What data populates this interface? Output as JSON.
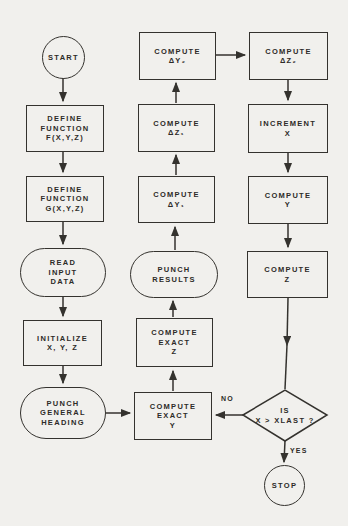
{
  "figure": {
    "type": "flowchart",
    "colors": {
      "paper": "#f1f0ed",
      "ink": "#34322e"
    }
  },
  "nodes": {
    "start": {
      "shape": "terminal-circle",
      "label": [
        "START"
      ]
    },
    "define_f": {
      "shape": "process-rect",
      "label": [
        "DEFINE",
        "FUNCTION",
        "F(X,Y,Z)"
      ]
    },
    "define_g": {
      "shape": "process-rect",
      "label": [
        "DEFINE",
        "FUNCTION",
        "G(X,Y,Z)"
      ]
    },
    "read_input": {
      "shape": "io-stadium",
      "label": [
        "READ",
        "INPUT",
        "DATA"
      ]
    },
    "initialize": {
      "shape": "process-rect",
      "label": [
        "INITIALIZE",
        "X, Y, Z"
      ]
    },
    "punch_heading": {
      "shape": "io-stadium",
      "label": [
        "PUNCH",
        "GENERAL",
        "HEADING"
      ]
    },
    "compute_dy2": {
      "shape": "process-rect",
      "label": [
        "COMPUTE",
        "ΔY₂"
      ]
    },
    "compute_dz1": {
      "shape": "process-rect",
      "label": [
        "COMPUTE",
        "ΔZ₁"
      ]
    },
    "compute_dy1": {
      "shape": "process-rect",
      "label": [
        "COMPUTE",
        "ΔY₁"
      ]
    },
    "punch_results": {
      "shape": "io-stadium",
      "label": [
        "PUNCH",
        "RESULTS"
      ]
    },
    "compute_exact_z": {
      "shape": "process-rect",
      "label": [
        "COMPUTE",
        "EXACT",
        "Z"
      ]
    },
    "compute_exact_y": {
      "shape": "process-rect",
      "label": [
        "COMPUTE",
        "EXACT",
        "Y"
      ]
    },
    "compute_dz2": {
      "shape": "process-rect",
      "label": [
        "COMPUTE",
        "ΔZ₂"
      ]
    },
    "increment_x": {
      "shape": "process-rect",
      "label": [
        "INCREMENT",
        "X"
      ]
    },
    "compute_y": {
      "shape": "process-rect",
      "label": [
        "COMPUTE",
        "Y"
      ]
    },
    "compute_z": {
      "shape": "process-rect",
      "label": [
        "COMPUTE",
        "Z"
      ]
    },
    "decision_xlast": {
      "shape": "decision-diamond",
      "label": [
        "IS",
        "X > XLAST ?"
      ]
    },
    "stop": {
      "shape": "terminal-circle",
      "label": [
        "STOP"
      ]
    }
  },
  "edge_labels": {
    "no": "NO",
    "yes": "YES"
  },
  "edges": [
    {
      "from": "start",
      "to": "define_f"
    },
    {
      "from": "define_f",
      "to": "define_g"
    },
    {
      "from": "define_g",
      "to": "read_input"
    },
    {
      "from": "read_input",
      "to": "initialize"
    },
    {
      "from": "initialize",
      "to": "punch_heading"
    },
    {
      "from": "punch_heading",
      "to": "compute_exact_y"
    },
    {
      "from": "compute_exact_y",
      "to": "compute_exact_z"
    },
    {
      "from": "compute_exact_z",
      "to": "punch_results"
    },
    {
      "from": "punch_results",
      "to": "compute_dy1"
    },
    {
      "from": "compute_dy1",
      "to": "compute_dz1"
    },
    {
      "from": "compute_dz1",
      "to": "compute_dy2"
    },
    {
      "from": "compute_dy2",
      "to": "compute_dz2"
    },
    {
      "from": "compute_dz2",
      "to": "increment_x"
    },
    {
      "from": "increment_x",
      "to": "compute_y"
    },
    {
      "from": "compute_y",
      "to": "compute_z"
    },
    {
      "from": "compute_z",
      "to": "decision_xlast"
    },
    {
      "from": "decision_xlast",
      "to": "compute_exact_y",
      "label": "NO"
    },
    {
      "from": "decision_xlast",
      "to": "stop",
      "label": "YES"
    }
  ]
}
